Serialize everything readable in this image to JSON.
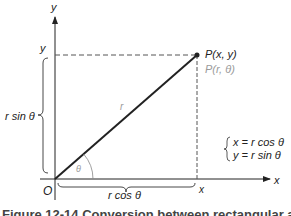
{
  "diagram": {
    "axes": {
      "x_label": "x",
      "y_label": "y",
      "origin_label": "O"
    },
    "point": {
      "cartesian_label": "P(x, y)",
      "polar_label": "P(r, θ)"
    },
    "projections": {
      "x_tick_label": "x",
      "y_tick_label": "y"
    },
    "segments": {
      "radius_label": "r",
      "angle_label": "θ",
      "vertical_brace_label": "r sin θ",
      "horizontal_brace_label": "r cos θ"
    },
    "equations": [
      "x = r cos θ",
      "y = r sin θ"
    ],
    "colors": {
      "line": "#222222",
      "dashed": "#555555",
      "secondary_text": "#9a9a9a"
    }
  },
  "caption": "Figure 12-14  Conversion between rectangular and polar coordinates"
}
